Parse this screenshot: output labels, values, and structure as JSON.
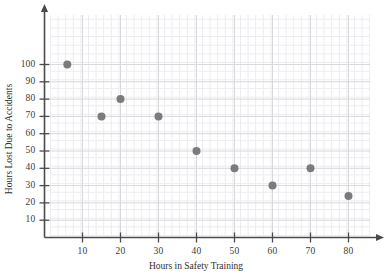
{
  "chart_data": {
    "type": "scatter",
    "title": "",
    "xlabel": "Hours in Safety Training",
    "ylabel": "Hours Lost Due to Accidents",
    "xlim": [
      0,
      85
    ],
    "ylim": [
      0,
      108
    ],
    "xticks": [
      10,
      20,
      30,
      40,
      50,
      60,
      70,
      80
    ],
    "yticks": [
      10,
      20,
      30,
      40,
      50,
      60,
      70,
      80,
      90,
      100
    ],
    "xtick_labels": [
      "10",
      "20",
      "30",
      "40",
      "50",
      "60",
      "70",
      "80"
    ],
    "ytick_labels": [
      "10",
      "20",
      "30",
      "40",
      "50",
      "60",
      "70",
      "80",
      "90",
      "100"
    ],
    "grid": true,
    "grid_minor": true,
    "legend": null,
    "x": [
      6,
      15,
      20,
      30,
      40,
      50,
      60,
      70,
      80
    ],
    "y": [
      100,
      70,
      80,
      70,
      50,
      40,
      30,
      40,
      24
    ],
    "points": [
      {
        "x": 6,
        "y": 100
      },
      {
        "x": 15,
        "y": 70
      },
      {
        "x": 20,
        "y": 80
      },
      {
        "x": 30,
        "y": 70
      },
      {
        "x": 40,
        "y": 50
      },
      {
        "x": 50,
        "y": 40
      },
      {
        "x": 60,
        "y": 30
      },
      {
        "x": 70,
        "y": 40
      },
      {
        "x": 80,
        "y": 24
      }
    ],
    "marker": {
      "shape": "circle",
      "color": "#7b7b7b",
      "radius": 4
    },
    "colors": {
      "axis": "#4a4a4a",
      "grid_major": "#d8d8dd",
      "grid_minor": "#ededf1",
      "text": "#2e2e2e",
      "background": "#ffffff"
    }
  }
}
